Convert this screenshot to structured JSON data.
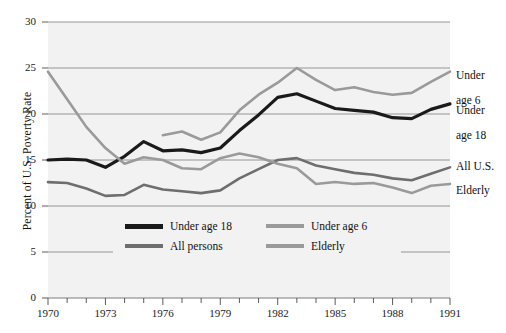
{
  "chart_data": {
    "type": "line",
    "title": "",
    "xlabel": "",
    "ylabel": "Percent of U.S. Poverty Rate",
    "xlim": [
      1970,
      1991
    ],
    "ylim": [
      0,
      30
    ],
    "grid": true,
    "legend_position": "inside-bottom-center",
    "y_ticks": [
      "30",
      "25",
      "20",
      "15",
      "10",
      "5",
      "0"
    ],
    "y_tick_values": [
      30,
      25,
      20,
      15,
      10,
      5,
      0
    ],
    "x_ticks": [
      "1970",
      "1973",
      "1976",
      "1979",
      "1982",
      "1985",
      "1988",
      "1991"
    ],
    "x_tick_values": [
      1970,
      1973,
      1976,
      1979,
      1982,
      1985,
      1988,
      1991
    ],
    "x": [
      1970,
      1971,
      1972,
      1973,
      1974,
      1975,
      1976,
      1977,
      1978,
      1979,
      1980,
      1981,
      1982,
      1983,
      1984,
      1985,
      1986,
      1987,
      1988,
      1989,
      1990,
      1991
    ],
    "series": [
      {
        "name": "Under age 18",
        "color": "#1a1a1a",
        "x": [
          1970,
          1971,
          1972,
          1973,
          1974,
          1975,
          1976,
          1977,
          1978,
          1979,
          1980,
          1981,
          1982,
          1983,
          1984,
          1985,
          1986,
          1987,
          1988,
          1989,
          1990,
          1991
        ],
        "values": [
          15.0,
          15.1,
          15.0,
          14.2,
          15.4,
          17.0,
          16.0,
          16.1,
          15.8,
          16.3,
          18.2,
          19.9,
          21.8,
          22.2,
          21.4,
          20.6,
          20.4,
          20.2,
          19.6,
          19.5,
          20.5,
          21.1
        ]
      },
      {
        "name": "Under age 6",
        "color": "#9a9a9a",
        "x": [
          1976,
          1977,
          1978,
          1979,
          1980,
          1981,
          1982,
          1983,
          1984,
          1985,
          1986,
          1987,
          1988,
          1989,
          1990,
          1991
        ],
        "values": [
          17.7,
          18.1,
          17.2,
          18.0,
          20.4,
          22.1,
          23.4,
          25.0,
          23.7,
          22.6,
          22.9,
          22.4,
          22.1,
          22.3,
          23.5,
          24.6
        ]
      },
      {
        "name": "All persons",
        "color": "#6e6e6e",
        "x": [
          1970,
          1971,
          1972,
          1973,
          1974,
          1975,
          1976,
          1977,
          1978,
          1979,
          1980,
          1981,
          1982,
          1983,
          1984,
          1985,
          1986,
          1987,
          1988,
          1989,
          1990,
          1991
        ],
        "values": [
          12.6,
          12.5,
          11.9,
          11.1,
          11.2,
          12.3,
          11.8,
          11.6,
          11.4,
          11.7,
          13.0,
          14.0,
          15.0,
          15.2,
          14.4,
          14.0,
          13.6,
          13.4,
          13.0,
          12.8,
          13.5,
          14.2
        ]
      },
      {
        "name": "Elderly",
        "color": "#9a9a9a",
        "x": [
          1970,
          1971,
          1972,
          1973,
          1974,
          1975,
          1976,
          1977,
          1978,
          1979,
          1980,
          1981,
          1982,
          1983,
          1984,
          1985,
          1986,
          1987,
          1988,
          1989,
          1990,
          1991
        ],
        "values": [
          24.6,
          21.6,
          18.6,
          16.3,
          14.6,
          15.3,
          15.0,
          14.1,
          14.0,
          15.2,
          15.7,
          15.3,
          14.6,
          14.1,
          12.4,
          12.6,
          12.4,
          12.5,
          12.0,
          11.4,
          12.2,
          12.4
        ]
      }
    ],
    "annotations": [
      {
        "text": "Under\nage 6",
        "series": "Under age 6",
        "year": 1991,
        "value": 24.6
      },
      {
        "text": "Under\nage 18",
        "series": "Under age 18",
        "year": 1991,
        "value": 21.1
      },
      {
        "text": "All U.S.",
        "series": "All persons",
        "year": 1991,
        "value": 14.2
      },
      {
        "text": "Elderly",
        "series": "Elderly",
        "year": 1991,
        "value": 12.4
      }
    ],
    "legend": [
      {
        "label": "Under age 18",
        "color": "#1a1a1a"
      },
      {
        "label": "Under age 6",
        "color": "#9a9a9a"
      },
      {
        "label": "All persons",
        "color": "#6e6e6e"
      },
      {
        "label": "Elderly",
        "color": "#9a9a9a"
      }
    ]
  },
  "axis": {
    "y_title": "Percent of U.S. Poverty Rate",
    "y_ticks": [
      "30",
      "25",
      "20",
      "15",
      "10",
      "5",
      "0"
    ],
    "x_ticks": [
      "1970",
      "1973",
      "1976",
      "1979",
      "1982",
      "1985",
      "1988",
      "1991"
    ]
  },
  "side_labels": {
    "under_age_6_line1": "Under",
    "under_age_6_line2": "age 6",
    "under_age_18_line1": "Under",
    "under_age_18_line2": "age 18",
    "all_us": "All U.S.",
    "elderly": "Elderly"
  },
  "legend": {
    "under_age_18": "Under age 18",
    "under_age_6": "Under age 6",
    "all_persons": "All persons",
    "elderly": "Elderly"
  },
  "colors": {
    "black_series": "#1a1a1a",
    "mid_gray_series": "#6e6e6e",
    "light_gray_series": "#9a9a9a",
    "plot_background": "#f2f2f2",
    "gridline": "#7d7d7d",
    "page_background": "#ffffff"
  }
}
